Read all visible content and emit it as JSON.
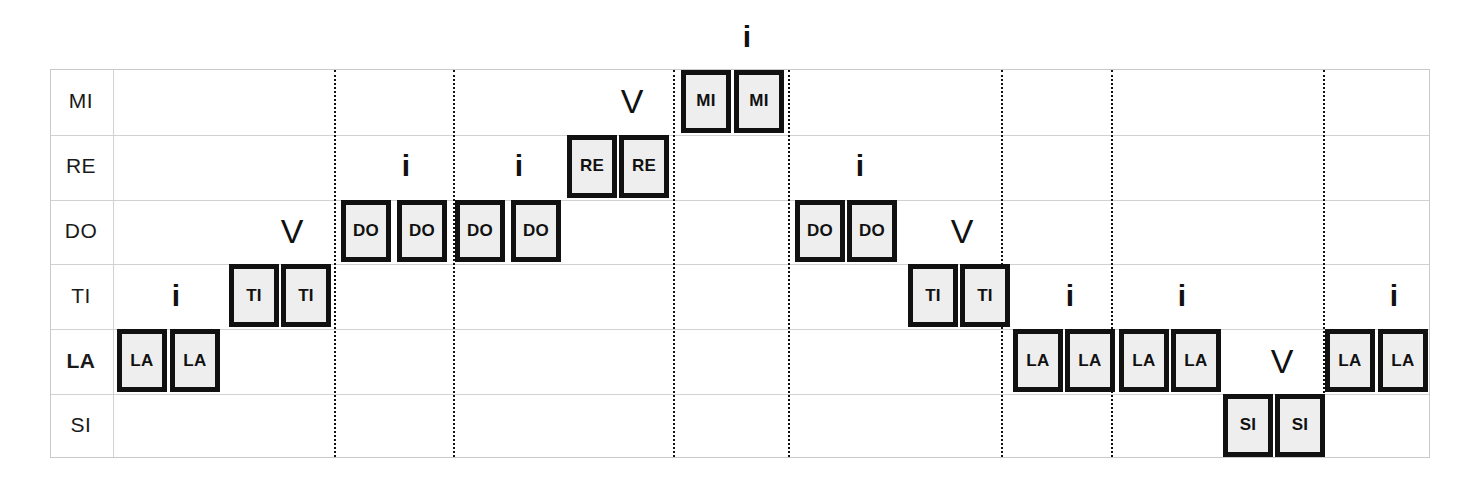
{
  "diagram": {
    "rows": [
      {
        "label": "MI",
        "accent": false
      },
      {
        "label": "RE",
        "accent": false
      },
      {
        "label": "DO",
        "accent": false
      },
      {
        "label": "TI",
        "accent": false
      },
      {
        "label": "LA",
        "accent": true
      },
      {
        "label": "SI",
        "accent": false
      }
    ],
    "colors": {
      "box_fill": "#EEEEEE",
      "box_border": "#111111",
      "grid_line": "#D2D2D2",
      "divider": "#111111",
      "text": "#1A1A1A"
    },
    "markers": {
      "up_glyph": "i",
      "down_glyph": "V"
    },
    "notes": [
      {
        "id": "n01",
        "label": "LA",
        "row": 4,
        "x": 117
      },
      {
        "id": "n02",
        "label": "LA",
        "row": 4,
        "x": 170
      },
      {
        "id": "n03",
        "label": "TI",
        "row": 3,
        "x": 229
      },
      {
        "id": "n04",
        "label": "TI",
        "row": 3,
        "x": 281
      },
      {
        "id": "n05",
        "label": "DO",
        "row": 2,
        "x": 341
      },
      {
        "id": "n06",
        "label": "DO",
        "row": 2,
        "x": 397
      },
      {
        "id": "n07",
        "label": "DO",
        "row": 2,
        "x": 455
      },
      {
        "id": "n08",
        "label": "DO",
        "row": 2,
        "x": 511
      },
      {
        "id": "n09",
        "label": "RE",
        "row": 1,
        "x": 567
      },
      {
        "id": "n10",
        "label": "RE",
        "row": 1,
        "x": 619
      },
      {
        "id": "n11",
        "label": "MI",
        "row": 0,
        "x": 681
      },
      {
        "id": "n12",
        "label": "MI",
        "row": 0,
        "x": 734
      },
      {
        "id": "n13",
        "label": "DO",
        "row": 2,
        "x": 795
      },
      {
        "id": "n14",
        "label": "DO",
        "row": 2,
        "x": 847
      },
      {
        "id": "n15",
        "label": "TI",
        "row": 3,
        "x": 908
      },
      {
        "id": "n16",
        "label": "TI",
        "row": 3,
        "x": 960
      },
      {
        "id": "n17",
        "label": "LA",
        "row": 4,
        "x": 1013
      },
      {
        "id": "n18",
        "label": "LA",
        "row": 4,
        "x": 1065
      },
      {
        "id": "n19",
        "label": "LA",
        "row": 4,
        "x": 1119
      },
      {
        "id": "n20",
        "label": "LA",
        "row": 4,
        "x": 1171
      },
      {
        "id": "n21",
        "label": "SI",
        "row": 5,
        "x": 1223
      },
      {
        "id": "n22",
        "label": "SI",
        "row": 5,
        "x": 1275
      },
      {
        "id": "n23",
        "label": "LA",
        "row": 4,
        "x": 1325
      },
      {
        "id": "n24",
        "label": "LA",
        "row": 4,
        "x": 1378
      }
    ],
    "direction_markers": [
      {
        "id": "m01",
        "glyph": "i",
        "kind": "up",
        "row": 3,
        "x": 156
      },
      {
        "id": "m02",
        "glyph": "V",
        "kind": "down",
        "row": 2,
        "x": 272
      },
      {
        "id": "m03",
        "glyph": "i",
        "kind": "up",
        "row": 1,
        "x": 386
      },
      {
        "id": "m04",
        "glyph": "i",
        "kind": "up",
        "row": 1,
        "x": 499
      },
      {
        "id": "m05",
        "glyph": "V",
        "kind": "down",
        "row": 0,
        "x": 612
      },
      {
        "id": "m06",
        "glyph": "i",
        "kind": "up",
        "row": -1,
        "x": 727
      },
      {
        "id": "m07",
        "glyph": "i",
        "kind": "up",
        "row": 1,
        "x": 840
      },
      {
        "id": "m08",
        "glyph": "V",
        "kind": "down",
        "row": 2,
        "x": 942
      },
      {
        "id": "m09",
        "glyph": "i",
        "kind": "up",
        "row": 3,
        "x": 1050
      },
      {
        "id": "m10",
        "glyph": "i",
        "kind": "up",
        "row": 3,
        "x": 1162
      },
      {
        "id": "m11",
        "glyph": "V",
        "kind": "down",
        "row": 4,
        "x": 1262
      },
      {
        "id": "m12",
        "glyph": "i",
        "kind": "up",
        "row": 3,
        "x": 1374
      }
    ],
    "dividers": [
      333,
      452,
      672,
      787,
      1000,
      1110,
      1322
    ],
    "geometry": {
      "grid_left": 50,
      "grid_top": 69,
      "grid_width": 1380,
      "grid_height": 389,
      "label_col_width": 62,
      "row_height": 64.8,
      "box_width": 50,
      "marker_width": 40
    }
  }
}
